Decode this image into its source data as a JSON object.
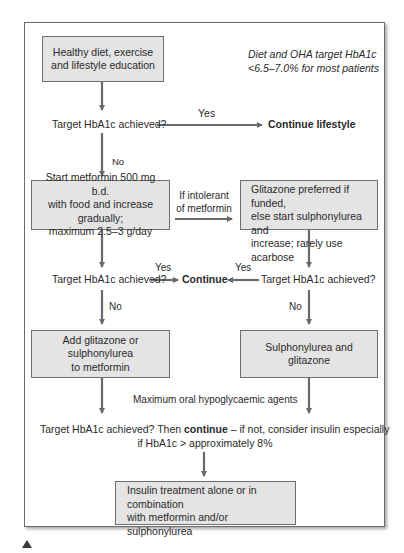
{
  "diagram": {
    "note": {
      "line1": "Diet and OHA target HbA1c",
      "line2": "<6.5–7.0% for most patients"
    },
    "nodes": {
      "lifestyle": {
        "line1": "Healthy diet, exercise",
        "line2": "and lifestyle education"
      },
      "target1": "Target HbA1c achieved?",
      "continue_lifestyle": "Continue lifestyle",
      "metformin": {
        "line1": "Start metformin 500 mg b.d.",
        "line2": "with food and increase gradually;",
        "line3": "maximum 2.5–3 g/day"
      },
      "glitazone_pref": {
        "line1": "Glitazone preferred if funded,",
        "line2": "else start sulphonylurea and",
        "line3": "increase; rarely use acarbose"
      },
      "target2_left": "Target HbA1c achieved?",
      "continue": "Continue",
      "target2_right": "Target HbA1c achieved?",
      "add_glitazone": {
        "line1": "Add glitazone or sulphonylurea",
        "line2": "to metformin"
      },
      "sulph_glitazone": "Sulphonylurea and glitazone",
      "max_oral": "Maximum oral hypoglycaemic agents",
      "final_question": {
        "part1": "Target HbA1c achieved? Then ",
        "bold": "continue",
        "part2": " – if not, consider insulin especially",
        "line2": "if HbA1c > approximately 8%"
      },
      "insulin": {
        "line1": "Insulin treatment alone or in combination",
        "line2": "with metformin and/or sulphonylurea"
      }
    },
    "edge_labels": {
      "yes_top": "Yes",
      "no_top": "No",
      "intolerant_line1": "If intolerant",
      "intolerant_line2": "of metformin",
      "yes_left": "Yes",
      "yes_right": "Yes",
      "no_left": "No",
      "no_right": "No"
    },
    "colors": {
      "box_fill": "#e4e4e4",
      "box_border": "#6e6e6e",
      "arrow": "#6a6a6a",
      "text": "#2a2a2a"
    }
  }
}
